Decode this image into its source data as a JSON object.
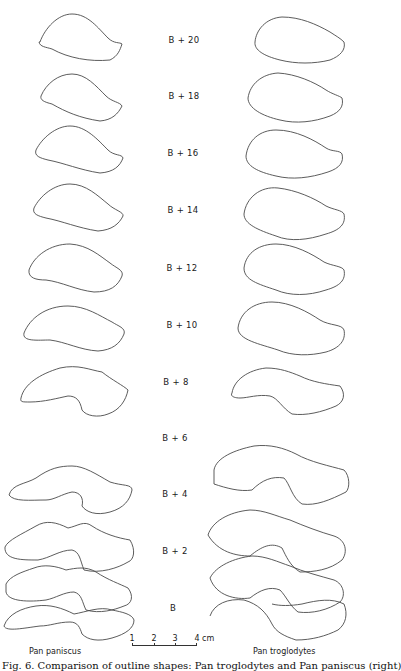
{
  "figure": {
    "stages": [
      "B + 20",
      "B + 18",
      "B + 16",
      "B + 14",
      "B + 12",
      "B + 10",
      "B + 8",
      "B + 6",
      "B + 4",
      "B + 2",
      "B"
    ],
    "species": {
      "left": "Pan paniscus",
      "right": "Pan troglodytes"
    },
    "scale_bar": {
      "ticks": [
        "1",
        "2",
        "3",
        "4"
      ],
      "unit": "cm"
    },
    "caption": "Fig. 6. Comparison of outline shapes: Pan troglodytes and Pan paniscus (right)",
    "line_color": "#4a4a4a",
    "background": "#ffffff"
  }
}
